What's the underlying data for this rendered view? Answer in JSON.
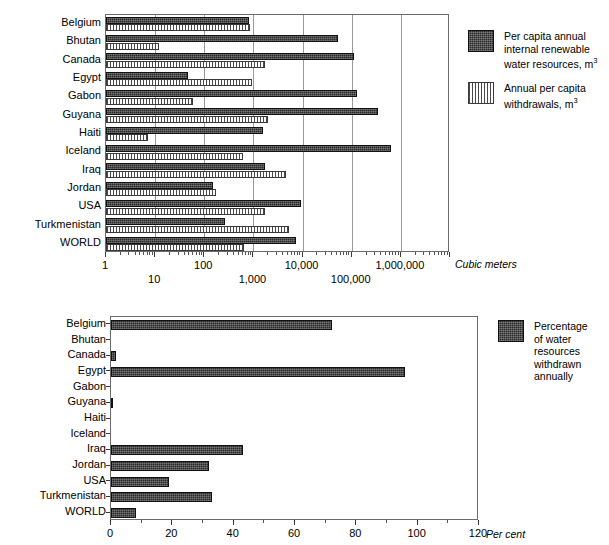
{
  "chart_data": [
    {
      "type": "bar",
      "title": "Per capita water resources and withdrawals",
      "orientation": "horizontal",
      "scale": "log",
      "xlabel": "Cubic meters",
      "ylabel": "",
      "xlim": [
        1,
        10000000
      ],
      "grid": true,
      "legend_position": "right",
      "tick_labels_upper": [
        "1",
        "100",
        "10,000",
        "1,000,000"
      ],
      "tick_labels_lower": [
        "10",
        "1,000",
        "100,000"
      ],
      "categories": [
        "Belgium",
        "Bhutan",
        "Canada",
        "Egypt",
        "Gabon",
        "Guyana",
        "Haiti",
        "Iceland",
        "Iraq",
        "Jordan",
        "USA",
        "Turkmenistan",
        "WORLD"
      ],
      "series": [
        {
          "name": "Per capita annual internal renewable water resources, m³",
          "pattern": "dark",
          "values": [
            830,
            52000,
            110000,
            47,
            130000,
            350000,
            1600,
            630000,
            1700,
            150,
            9200,
            270,
            7500
          ]
        },
        {
          "name": "Annual per capita withdrawals, m³",
          "pattern": "light-striped",
          "values": [
            860,
            12,
            1700,
            920,
            60,
            2000,
            7,
            600,
            4600,
            170,
            1700,
            5300,
            650
          ]
        }
      ]
    },
    {
      "type": "bar",
      "title": "Percentage of water resources withdrawn annually",
      "orientation": "horizontal",
      "scale": "linear",
      "xlabel": "Per cent",
      "ylabel": "",
      "xlim": [
        0,
        120
      ],
      "xticks": [
        0,
        20,
        40,
        60,
        80,
        100,
        120
      ],
      "grid": false,
      "legend_position": "right",
      "categories": [
        "Belgium",
        "Bhutan",
        "Canada",
        "Egypt",
        "Gabon",
        "Guyana",
        "Haiti",
        "Iceland",
        "Iraq",
        "Jordan",
        "USA",
        "Turkmenistan",
        "WORLD"
      ],
      "series": [
        {
          "name": "Percentage of water resources withdrawn annually",
          "pattern": "dark",
          "values": [
            72,
            0,
            1.6,
            96,
            0,
            0.7,
            0,
            0,
            43,
            32,
            19,
            33,
            8
          ]
        }
      ]
    }
  ],
  "top_chart": {
    "axis_title": "Cubic meters",
    "categories": [
      "Belgium",
      "Bhutan",
      "Canada",
      "Egypt",
      "Gabon",
      "Guyana",
      "Haiti",
      "Iceland",
      "Iraq",
      "Jordan",
      "USA",
      "Turkmenistan",
      "WORLD"
    ],
    "ticks_upper": [
      "1",
      "100",
      "10,000",
      "1,000,000"
    ],
    "ticks_lower": [
      "10",
      "1,000",
      "100,000"
    ],
    "legend": [
      {
        "pattern": "dark",
        "line1": "Per capita annual",
        "line2": "internal renewable",
        "line3": "water resources, m",
        "sup": "3"
      },
      {
        "pattern": "light",
        "line1": "Annual per capita",
        "line2": "withdrawals, m",
        "line3": "",
        "sup": "3"
      }
    ]
  },
  "bottom_chart": {
    "axis_title": "Per cent",
    "categories": [
      "Belgium",
      "Bhutan",
      "Canada",
      "Egypt",
      "Gabon",
      "Guyana",
      "Haiti",
      "Iceland",
      "Iraq",
      "Jordan",
      "USA",
      "Turkmenistan",
      "WORLD"
    ],
    "ticks": [
      "0",
      "20",
      "40",
      "60",
      "80",
      "100",
      "120"
    ],
    "legend": [
      {
        "pattern": "dark",
        "text": "Percentage\nof water\nresources\nwithdrawn\nannually"
      }
    ]
  }
}
